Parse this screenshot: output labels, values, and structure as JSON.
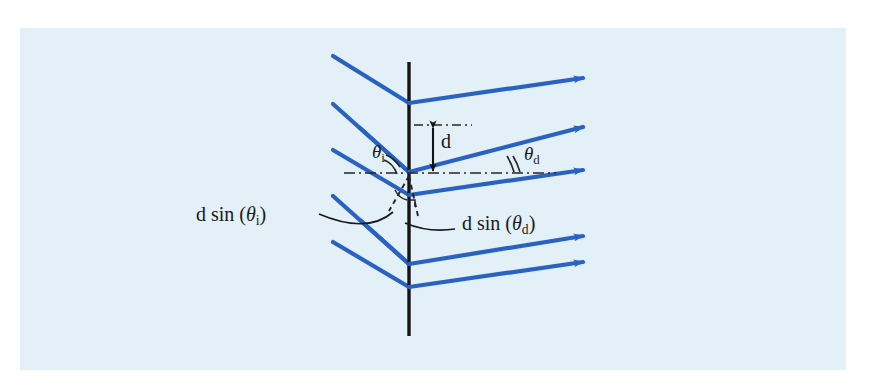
{
  "figure": {
    "kind": "optics-diffraction-grating-diagram",
    "background_color": "#e3f0f8",
    "page_color": "#ffffff",
    "ray_color": "#2a62c4",
    "grating_line_color": "#141414",
    "annotation_color": "#1a1a1a",
    "panel": {
      "x": 20,
      "y": 28,
      "width": 826,
      "height": 342
    }
  },
  "labels": {
    "theta_i": {
      "greek": "θ",
      "sub": "i",
      "x": 375,
      "y": 150
    },
    "theta_d": {
      "greek": "θ",
      "sub": "d",
      "x": 523,
      "y": 152
    },
    "spacing_d": {
      "text": "d",
      "x": 437,
      "y": 133
    },
    "d_sin_theta_i": {
      "prefix": "d sin (",
      "greek": "θ",
      "sub": "i",
      "suffix": ")",
      "x": 251,
      "y": 216
    },
    "d_sin_theta_d": {
      "prefix": "d sin (",
      "greek": "θ",
      "sub": "d",
      "suffix": ")",
      "x": 460,
      "y": 224
    }
  },
  "geometry": {
    "grating_x": 409,
    "grating_top_y": 62,
    "grating_bottom_y": 336,
    "nodes_y": [
      103,
      172,
      195,
      264,
      287,
      333
    ],
    "incident_rays": [
      {
        "x1": 333,
        "y1": 56,
        "x2": 409,
        "y2": 103
      },
      {
        "x1": 333,
        "y1": 104,
        "x2": 409,
        "y2": 172
      },
      {
        "x1": 333,
        "y1": 150,
        "x2": 409,
        "y2": 195
      },
      {
        "x1": 333,
        "y1": 196,
        "x2": 409,
        "y2": 264
      },
      {
        "x1": 333,
        "y1": 242,
        "x2": 409,
        "y2": 287
      }
    ],
    "diffracted_rays": [
      {
        "x1": 409,
        "y1": 103,
        "x2": 589,
        "y2": 77
      },
      {
        "x1": 409,
        "y1": 172,
        "x2": 589,
        "y2": 126
      },
      {
        "x1": 409,
        "y1": 195,
        "x2": 589,
        "y2": 170
      },
      {
        "x1": 409,
        "y1": 264,
        "x2": 589,
        "y2": 235
      },
      {
        "x1": 409,
        "y1": 287,
        "x2": 589,
        "y2": 262
      }
    ],
    "dashdot_lines": [
      {
        "x1": 416,
        "y1": 125,
        "x2": 470,
        "y2": 125
      },
      {
        "x1": 344,
        "y1": 173,
        "x2": 555,
        "y2": 173
      }
    ]
  }
}
